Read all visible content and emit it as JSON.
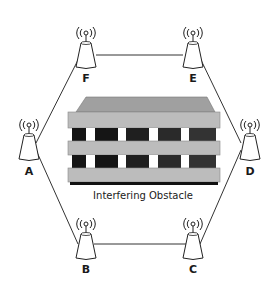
{
  "diagram": {
    "type": "wireless-mesh-network",
    "colors": {
      "link": "#333333",
      "tower_fill": "#ffffff",
      "tower_stroke": "#222222",
      "obstacle_top": "#a8a8a8",
      "obstacle_band": "#b8b8b8",
      "obstacle_window": "#1c1c1c",
      "obstacle_gap": "#ffffff",
      "obstacle_base": "#111111"
    },
    "nodes": [
      {
        "id": "A",
        "label": "A",
        "x": 29,
        "y": 143
      },
      {
        "id": "B",
        "label": "B",
        "x": 86,
        "y": 246
      },
      {
        "id": "C",
        "label": "C",
        "x": 192,
        "y": 246
      },
      {
        "id": "D",
        "label": "D",
        "x": 249,
        "y": 143
      },
      {
        "id": "E",
        "label": "E",
        "x": 193,
        "y": 54
      },
      {
        "id": "F",
        "label": "F",
        "x": 86,
        "y": 54
      }
    ],
    "links": [
      [
        "A",
        "F"
      ],
      [
        "F",
        "E"
      ],
      [
        "E",
        "D"
      ],
      [
        "D",
        "C"
      ],
      [
        "C",
        "B"
      ],
      [
        "B",
        "A"
      ]
    ],
    "obstacle": {
      "label": "Interfering Obstacle"
    }
  }
}
